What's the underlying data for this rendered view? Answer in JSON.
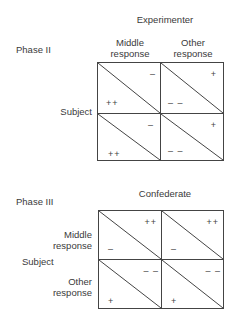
{
  "phase2": {
    "phase_label": "Phase II",
    "column_header": "Experimenter",
    "column_labels": [
      "Middle\nresponse",
      "Other\nresponse"
    ],
    "column_label_lines": [
      [
        "Middle",
        "response"
      ],
      [
        "Other",
        "response"
      ]
    ],
    "row_header": "Subject",
    "cells": [
      [
        {
          "upper_right": "–",
          "lower_left": "++"
        },
        {
          "upper_right": "+",
          "lower_left": "– –"
        }
      ],
      [
        {
          "upper_right": "–",
          "lower_left": "++"
        },
        {
          "upper_right": "+",
          "lower_left": "– –"
        }
      ]
    ]
  },
  "phase3": {
    "phase_label": "Phase III",
    "column_header": "Confederate",
    "row_header": "Subject",
    "row_label_lines": [
      [
        "Middle",
        "response"
      ],
      [
        "Other",
        "response"
      ]
    ],
    "cells": [
      [
        {
          "upper_right": "++",
          "lower_left": "–"
        },
        {
          "upper_right": "++",
          "lower_left": "–"
        }
      ],
      [
        {
          "upper_right": "– –",
          "lower_left": "+"
        },
        {
          "upper_right": "– –",
          "lower_left": "+"
        }
      ]
    ]
  },
  "colors": {
    "lines": "#444444",
    "text": "#3a3a3a"
  }
}
